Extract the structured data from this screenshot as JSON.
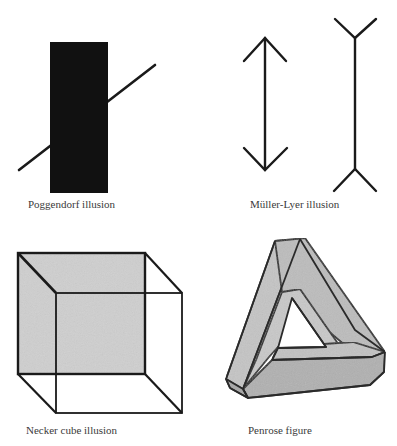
{
  "figure": {
    "panels": [
      {
        "id": "poggendorf",
        "caption": "Poggendorf illusion"
      },
      {
        "id": "muller-lyer",
        "caption": "Müller-Lyer illusion"
      },
      {
        "id": "necker",
        "caption": "Necker cube illusion"
      },
      {
        "id": "penrose",
        "caption": "Penrose figure"
      }
    ]
  },
  "colors": {
    "background": "#ffffff",
    "ink": "#1a1a1a",
    "poggendorf_bar": "#111111",
    "necker_face": "#cfcfcf",
    "penrose_fill": "#bdbdbd",
    "penrose_shadow": "#a8a8a8",
    "caption_text": "#3a3a3a"
  }
}
